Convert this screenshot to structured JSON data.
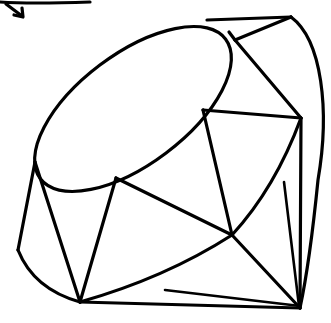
{
  "image": {
    "subject": "gem-line-drawing",
    "description": "Black line sketch of a faceted ruby gemstone on white background with a small arrow at top-left",
    "colors": {
      "stroke": "#000000",
      "background": "#ffffff"
    }
  }
}
